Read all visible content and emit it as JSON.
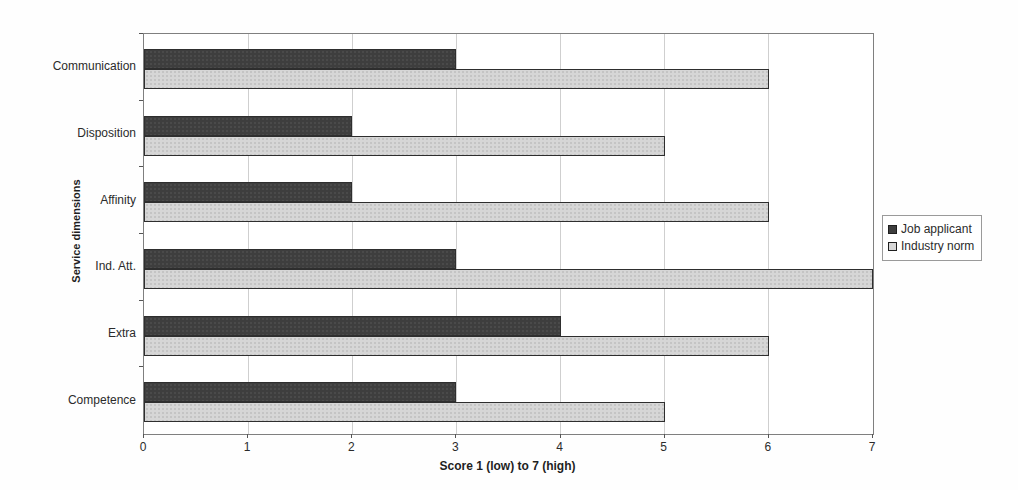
{
  "chart_data": {
    "type": "bar",
    "orientation": "horizontal",
    "categories": [
      "Communication",
      "Disposition",
      "Affinity",
      "Ind. Att.",
      "Extra",
      "Competence"
    ],
    "series": [
      {
        "name": "Job applicant",
        "color": "#3e3e3e",
        "values": [
          3,
          2,
          2,
          3,
          4,
          3
        ]
      },
      {
        "name": "Industry norm",
        "color": "#d6d6d6",
        "values": [
          6,
          5,
          6,
          7,
          6,
          5
        ]
      }
    ],
    "xlabel": "Score 1 (low) to 7 (high)",
    "ylabel": "Service dimensions",
    "xlim": [
      0,
      7
    ],
    "xticks": [
      "0",
      "1",
      "2",
      "3",
      "4",
      "5",
      "6",
      "7"
    ],
    "grid": "vertical-gridlines",
    "legend_position": "right-middle"
  },
  "colors": {
    "bar_dark": "#3e3e3e",
    "bar_light": "#d6d6d6",
    "bar_border": "#2e2e2e",
    "gridline": "#cfcfcf",
    "plot_border": "#7f7f7f",
    "text": "#2b2b2b"
  }
}
